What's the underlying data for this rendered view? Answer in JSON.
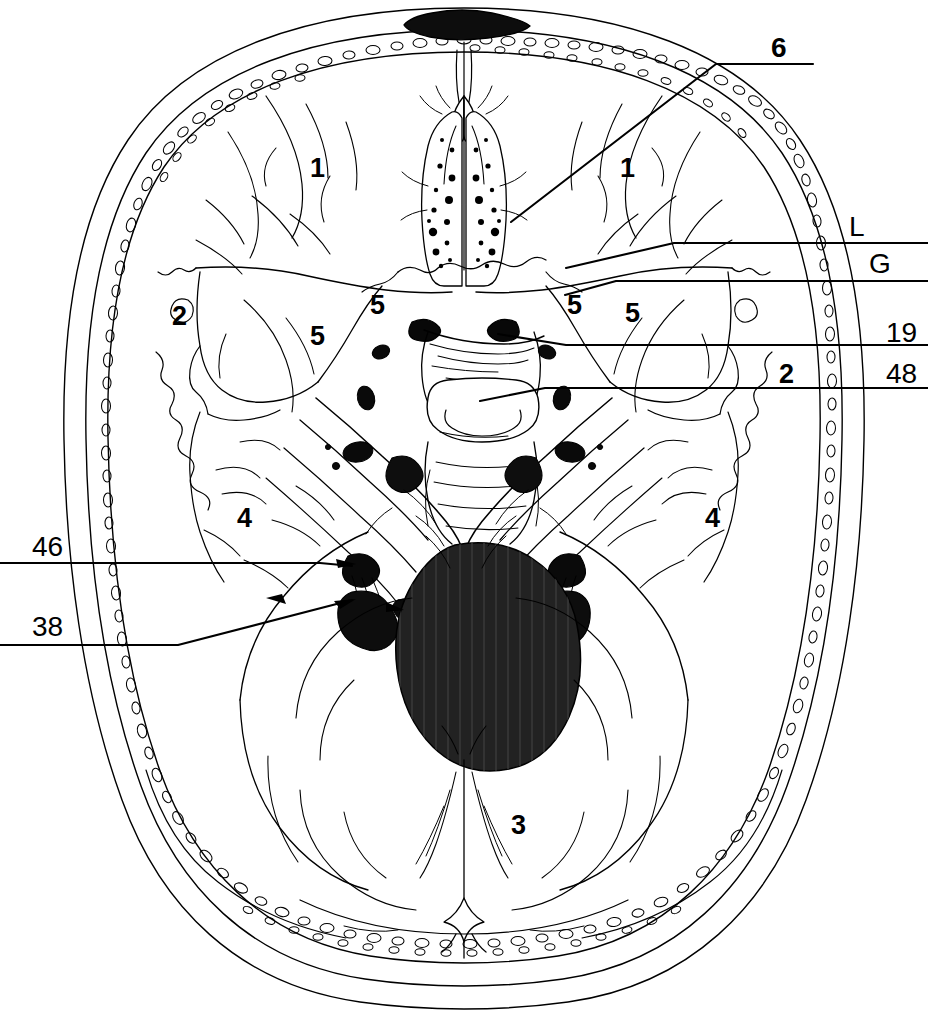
{
  "figure": {
    "view": "axial section through cranial base showing anterior, middle and posterior cranial fossae",
    "line_color": "#000000",
    "fill_color": "#ffffff",
    "accent_fill": "#1a1a1a",
    "stroke_width": 1.4
  },
  "interior_labels": [
    {
      "id": "anterior-fossa-left",
      "text": "1",
      "x": 310,
      "y": 155,
      "note": "left anterior cranial fossa"
    },
    {
      "id": "anterior-fossa-right",
      "text": "1",
      "x": 620,
      "y": 155,
      "note": "right anterior cranial fossa"
    },
    {
      "id": "calvaria-left",
      "text": "2",
      "x": 172,
      "y": 303,
      "note": "left cranial vault / diploe"
    },
    {
      "id": "calvaria-right",
      "text": "2",
      "x": 779,
      "y": 361,
      "note": "right cranial vault / diploe"
    },
    {
      "id": "posterior-fossa",
      "text": "3",
      "x": 511,
      "y": 812,
      "note": "posterior cranial fossa / occipital"
    },
    {
      "id": "middle-fossa-left",
      "text": "4",
      "x": 237,
      "y": 505,
      "note": "left middle cranial fossa"
    },
    {
      "id": "middle-fossa-right",
      "text": "4",
      "x": 705,
      "y": 505,
      "note": "right middle cranial fossa"
    },
    {
      "id": "lesser-wing-left-med",
      "text": "5",
      "x": 370,
      "y": 297,
      "note": "lesser wing of sphenoid, left medial"
    },
    {
      "id": "greater-wing-left",
      "text": "5",
      "x": 310,
      "y": 328,
      "note": "greater wing of sphenoid, left"
    },
    {
      "id": "lesser-wing-right-a",
      "text": "5",
      "x": 567,
      "y": 297,
      "note": "sphenoid wing, right medial"
    },
    {
      "id": "lesser-wing-right-b",
      "text": "5",
      "x": 625,
      "y": 305,
      "note": "sphenoid wing, right lateral"
    }
  ],
  "callout_labels": [
    {
      "id": "callout-6",
      "text": "6",
      "side": "right",
      "x": 771,
      "y": 42,
      "note": "cribriform plate of ethmoid"
    },
    {
      "id": "callout-L",
      "text": "L",
      "side": "right",
      "x": 849,
      "y": 213,
      "note": "L"
    },
    {
      "id": "callout-G",
      "text": "G",
      "side": "right",
      "x": 869,
      "y": 250,
      "note": "G"
    },
    {
      "id": "callout-19",
      "text": "19",
      "side": "right",
      "x": 886,
      "y": 319,
      "note": "19"
    },
    {
      "id": "callout-48",
      "text": "48",
      "side": "right",
      "x": 886,
      "y": 360,
      "note": "48"
    },
    {
      "id": "callout-46",
      "text": "46",
      "side": "left",
      "x": 32,
      "y": 533,
      "note": "46"
    },
    {
      "id": "callout-38",
      "text": "38",
      "side": "left",
      "x": 32,
      "y": 613,
      "note": "38"
    }
  ],
  "leader_lines": [
    {
      "id": "leader-6",
      "label": "6",
      "path": "M 813 64 L 716 64 L 511 222"
    },
    {
      "id": "leader-L",
      "label": "L",
      "path": "M 928 243 L 674 243 L 566 268"
    },
    {
      "id": "leader-G",
      "label": "G",
      "path": "M 928 281 L 616 281 L 565 295"
    },
    {
      "id": "leader-19",
      "label": "19",
      "path": "M 928 345 L 566 345 L 498 334"
    },
    {
      "id": "leader-48",
      "label": "48",
      "path": "M 928 388 L 545 388 L 480 401"
    },
    {
      "id": "leader-46",
      "label": "46",
      "path": "M 0 563 L 320 563 L 352 566"
    },
    {
      "id": "leader-38",
      "label": "38",
      "path": "M 0 645 L 178 645 L 352 600"
    }
  ]
}
